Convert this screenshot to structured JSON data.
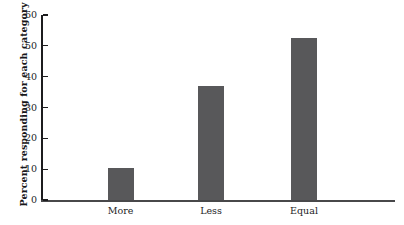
{
  "chart_data": {
    "type": "bar",
    "title": "",
    "subtitle": "",
    "xlabel": "",
    "ylabel": "Percent responding for each category",
    "categories": [
      "More",
      "Less",
      "Equal"
    ],
    "values": [
      10.5,
      37,
      52.5
    ],
    "ylim": [
      0,
      60
    ],
    "yticks": [
      0,
      10,
      20,
      30,
      40,
      50,
      60
    ],
    "ytick_labels": [
      "0",
      "10",
      "20",
      "30",
      "40",
      "50",
      "60"
    ],
    "grid": false,
    "legend": null,
    "bar_color": "#58585a",
    "axis_color": "#1c1c1e",
    "background": "#ffffff"
  }
}
